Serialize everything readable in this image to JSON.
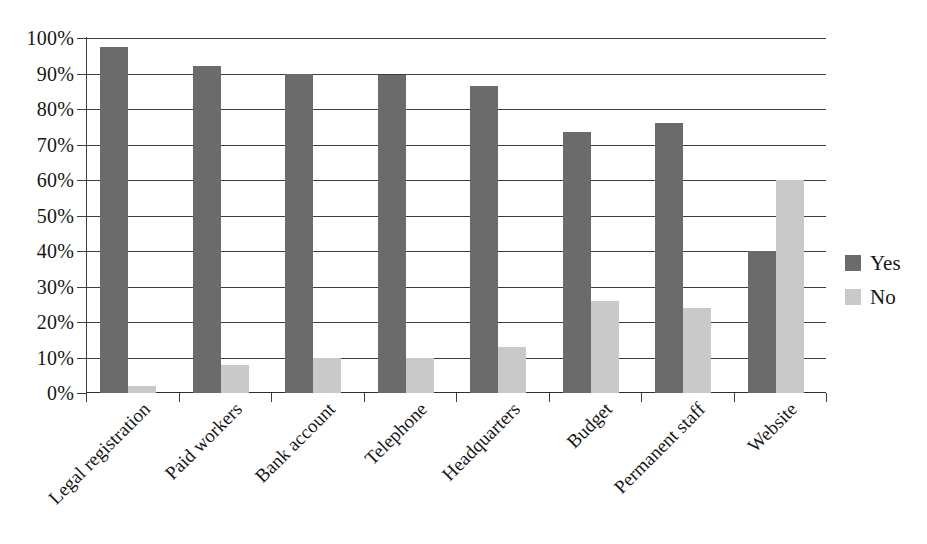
{
  "chart_data": {
    "type": "bar",
    "title": "",
    "subtitle": "",
    "xlabel": "",
    "ylabel": "",
    "ylim": [
      0,
      100
    ],
    "y_ticks": [
      "0%",
      "10%",
      "20%",
      "30%",
      "40%",
      "50%",
      "60%",
      "70%",
      "80%",
      "90%",
      "100%"
    ],
    "y_tick_values": [
      0,
      10,
      20,
      30,
      40,
      50,
      60,
      70,
      80,
      90,
      100
    ],
    "grid": "horizontal",
    "legend_position": "right",
    "categories": [
      "Legal registration",
      "Paid workers",
      "Bank account",
      "Telephone",
      "Headquarters",
      "Budget",
      "Permanent staff",
      "Website"
    ],
    "series": [
      {
        "name": "Yes",
        "color": "#6b6b6b",
        "values": [
          97.5,
          92,
          90,
          89.5,
          86.5,
          73.5,
          76,
          40
        ]
      },
      {
        "name": "No",
        "color": "#c9c9c9",
        "values": [
          2,
          8,
          10,
          10,
          13,
          26,
          24,
          60
        ]
      }
    ]
  },
  "legend": {
    "items": [
      {
        "label": "Yes",
        "swatch": "dark-gray-swatch"
      },
      {
        "label": "No",
        "swatch": "light-gray-swatch"
      }
    ]
  },
  "colors": {
    "series_yes": "#6b6b6b",
    "series_no": "#c9c9c9",
    "axis": "#3d3d3d",
    "text": "#161616",
    "background": "#ffffff"
  }
}
